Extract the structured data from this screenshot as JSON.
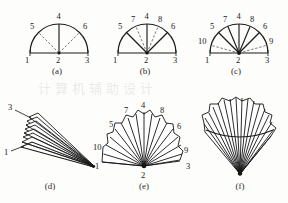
{
  "figure": {
    "kind": "line-drawing-figure",
    "background_color": "#fdfdfb",
    "ink_color": "#1a1a1a",
    "dash_color": "#4a4a4a",
    "watermark_text": "计算机辅助设计",
    "rows": 2,
    "columns": 3
  },
  "panels": [
    {
      "id": "a",
      "caption": "(a)",
      "type": "semicircle-diagram",
      "description": "half-disc with vertical solid spoke to 4 and two dashed spokes to 5 and 6",
      "solid_spokes": [
        "4"
      ],
      "dashed_spokes": [
        "5",
        "6"
      ],
      "labels": [
        {
          "text": "1",
          "role": "baseline-left"
        },
        {
          "text": "2",
          "role": "hub-center"
        },
        {
          "text": "3",
          "role": "baseline-right"
        },
        {
          "text": "4",
          "role": "apex-top"
        },
        {
          "text": "5",
          "role": "upper-left"
        },
        {
          "text": "6",
          "role": "upper-right"
        }
      ]
    },
    {
      "id": "b",
      "caption": "(b)",
      "type": "semicircle-diagram",
      "description": "half-disc with solid spokes to 5, 4, 6 and dashed spokes to 7 and 8",
      "solid_spokes": [
        "5",
        "4",
        "6"
      ],
      "dashed_spokes": [
        "7",
        "8"
      ],
      "labels": [
        {
          "text": "1",
          "role": "baseline-left"
        },
        {
          "text": "2",
          "role": "hub-center"
        },
        {
          "text": "3",
          "role": "baseline-right"
        },
        {
          "text": "4",
          "role": "apex-top"
        },
        {
          "text": "5",
          "role": "upper-left"
        },
        {
          "text": "6",
          "role": "upper-right"
        },
        {
          "text": "7",
          "role": "inner-left"
        },
        {
          "text": "8",
          "role": "inner-right"
        }
      ]
    },
    {
      "id": "c",
      "caption": "(c)",
      "type": "semicircle-diagram",
      "description": "half-disc with solid spokes to 5, 7, 4, 8, 6 and dashed spokes to 10 and 9",
      "solid_spokes": [
        "5",
        "7",
        "4",
        "8",
        "6"
      ],
      "dashed_spokes": [
        "10",
        "9"
      ],
      "labels": [
        {
          "text": "1",
          "role": "baseline-left"
        },
        {
          "text": "2",
          "role": "hub-center"
        },
        {
          "text": "3",
          "role": "baseline-right"
        },
        {
          "text": "4",
          "role": "apex-top"
        },
        {
          "text": "5",
          "role": "upper-left"
        },
        {
          "text": "6",
          "role": "upper-right"
        },
        {
          "text": "7",
          "role": "inner-left"
        },
        {
          "text": "8",
          "role": "inner-right"
        },
        {
          "text": "9",
          "role": "lower-right"
        },
        {
          "text": "10",
          "role": "lower-left"
        }
      ]
    },
    {
      "id": "d",
      "caption": "(d)",
      "type": "fan-rendering",
      "state": "closed",
      "description": "folded fan, narrow stacked blades converging to a point at lower right",
      "blade_count": 7,
      "labels": [
        {
          "text": "3",
          "role": "leader-top-left"
        },
        {
          "text": "1",
          "role": "leader-lower-left"
        }
      ]
    },
    {
      "id": "e",
      "caption": "(e)",
      "type": "fan-rendering",
      "state": "half-open",
      "description": "partially opened fan spread over roughly 180 degrees with scalloped leaf edge",
      "rib_count": 16,
      "labels": [
        {
          "text": "1",
          "role": "left-end"
        },
        {
          "text": "2",
          "role": "pivot-bottom"
        },
        {
          "text": "3",
          "role": "right-end"
        },
        {
          "text": "4",
          "role": "apex-top"
        },
        {
          "text": "5",
          "role": "upper-left"
        },
        {
          "text": "6",
          "role": "upper-right"
        },
        {
          "text": "7",
          "role": "inner-left"
        },
        {
          "text": "8",
          "role": "inner-right"
        },
        {
          "text": "9",
          "role": "lower-right"
        },
        {
          "text": "10",
          "role": "lower-left"
        }
      ]
    },
    {
      "id": "f",
      "caption": "(f)",
      "type": "fan-rendering",
      "state": "fully-open",
      "description": "fully opened fan, ribs radiating upward from a sharp pivot at the bottom",
      "rib_count": 18,
      "labels": []
    }
  ]
}
